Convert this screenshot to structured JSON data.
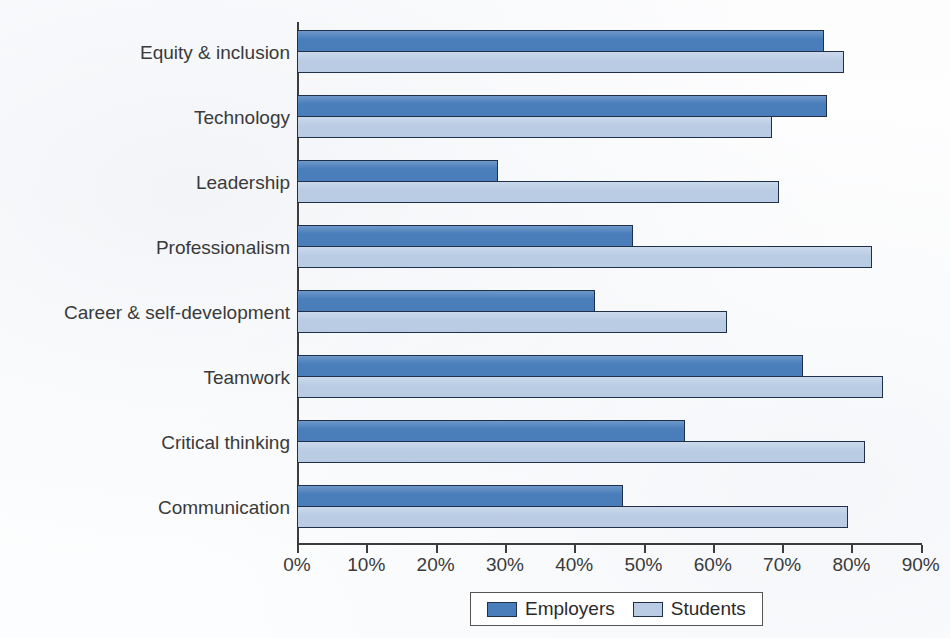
{
  "chart_data": {
    "type": "bar",
    "orientation": "horizontal",
    "title": "",
    "xlabel": "",
    "ylabel": "",
    "xlim": [
      0,
      90
    ],
    "grid": false,
    "legend_position": "bottom",
    "tick_labels": [
      "0%",
      "10%",
      "20%",
      "30%",
      "40%",
      "50%",
      "60%",
      "70%",
      "80%",
      "90%"
    ],
    "tick_values": [
      0,
      10,
      20,
      30,
      40,
      50,
      60,
      70,
      80,
      90
    ],
    "categories": [
      "Equity & inclusion",
      "Technology",
      "Leadership",
      "Professionalism",
      "Career & self-development",
      "Teamwork",
      "Critical thinking",
      "Communication"
    ],
    "series": [
      {
        "name": "Employers",
        "color": "#4a7ebb",
        "values": [
          76,
          76.5,
          29,
          48.5,
          43,
          73,
          56,
          47
        ]
      },
      {
        "name": "Students",
        "color": "#b9cce4",
        "values": [
          79,
          68.5,
          69.5,
          83,
          62,
          84.5,
          82,
          79.5
        ]
      }
    ]
  },
  "legend": {
    "entries": [
      {
        "label": "Employers",
        "swatch": "employers"
      },
      {
        "label": "Students",
        "swatch": "students"
      }
    ]
  }
}
